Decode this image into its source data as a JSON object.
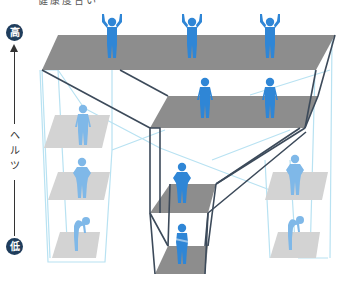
{
  "caption": "健康度合い",
  "axis": {
    "high_label": "高",
    "low_label": "低",
    "title_chars": [
      "ヘ",
      "ル",
      "ツ"
    ],
    "direction": "up"
  },
  "colors": {
    "figure_main": "#2f86d6",
    "figure_faded": "#7fb8e8",
    "platform_main": "#8c8c8c",
    "platform_faded": "#d0d0d0",
    "frame_main": "#3c4a5a",
    "frame_faded": "#b5dff0",
    "badge_bg": "#1f3d5c"
  },
  "levels": [
    {
      "name": "top-platform",
      "figures": 3,
      "pose": "arms-raised",
      "tone": "main"
    },
    {
      "name": "middle-platform",
      "figures": 2,
      "pose": "standing",
      "tone": "main"
    },
    {
      "name": "center-upper-platform",
      "figures": 1,
      "pose": "hands-on-hips",
      "tone": "main"
    },
    {
      "name": "center-lower-platform",
      "figures": 1,
      "pose": "arms-crossed",
      "tone": "main"
    },
    {
      "name": "left-upper-platform",
      "figures": 1,
      "pose": "standing",
      "tone": "faded"
    },
    {
      "name": "left-middle-platform",
      "figures": 1,
      "pose": "hands-on-hips",
      "tone": "faded"
    },
    {
      "name": "left-lower-platform",
      "figures": 1,
      "pose": "slumped",
      "tone": "faded"
    },
    {
      "name": "right-upper-platform",
      "figures": 1,
      "pose": "hands-on-hips",
      "tone": "faded"
    },
    {
      "name": "right-lower-platform",
      "figures": 1,
      "pose": "slumped",
      "tone": "faded"
    }
  ]
}
